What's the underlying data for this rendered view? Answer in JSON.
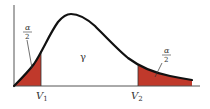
{
  "diagram": {
    "type": "distribution-curve",
    "colors": {
      "curve": "#111111",
      "tail_fill": "#c0392b",
      "axis": "#555555",
      "text": "#333333"
    },
    "labels": {
      "left_tail_num": "α",
      "left_tail_den": "2",
      "right_tail_num": "α",
      "right_tail_den": "2",
      "center": "γ",
      "v1_main": "V",
      "v1_sub": "1",
      "v2_main": "V",
      "v2_sub": "2"
    }
  }
}
